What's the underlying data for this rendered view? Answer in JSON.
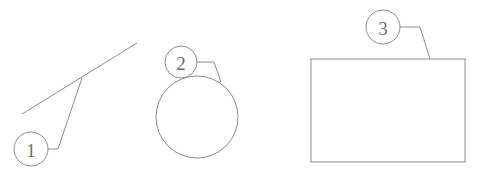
{
  "figure": {
    "title": "",
    "width": 479,
    "height": 183,
    "background_color": "#ffffff",
    "stroke_color": "#8d8d8d",
    "text_color": "#6e6e6e"
  },
  "callouts": [
    {
      "id": "callout-1",
      "label": "1",
      "circle": {
        "cx": 31,
        "cy": 149,
        "r": 17
      },
      "leader_points": "48,149 58,149 82,78",
      "target": "diagonal-line"
    },
    {
      "id": "callout-2",
      "label": "2",
      "circle": {
        "cx": 181,
        "cy": 62,
        "r": 16
      },
      "leader_points": "197,62 214,62 221,82",
      "target": "large-circle"
    },
    {
      "id": "callout-3",
      "label": "3",
      "circle": {
        "cx": 383,
        "cy": 27,
        "r": 17
      },
      "leader_points": "400,27 420,27 430,59",
      "target": "rectangle"
    }
  ],
  "shapes": [
    {
      "id": "diagonal-line",
      "type": "line",
      "x1": 22,
      "y1": 114,
      "x2": 137,
      "y2": 43
    },
    {
      "id": "large-circle",
      "type": "circle",
      "cx": 197,
      "cy": 117,
      "r": 41
    },
    {
      "id": "rectangle",
      "type": "rect",
      "x": 311,
      "y": 59,
      "width": 154,
      "height": 103
    }
  ]
}
